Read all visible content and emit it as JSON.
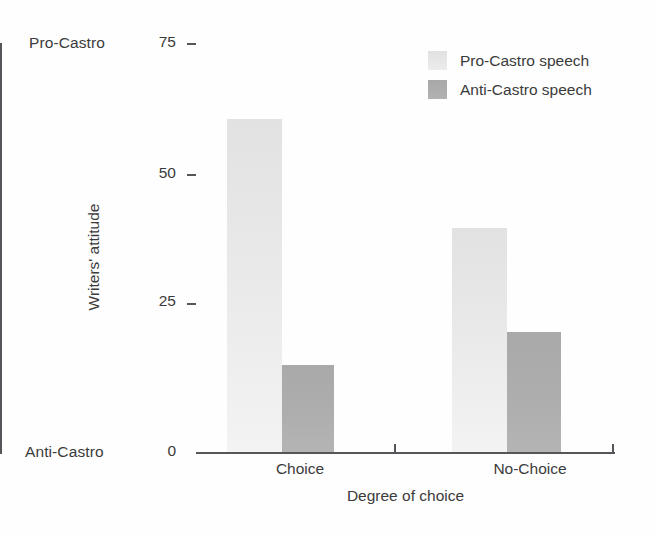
{
  "chart_data": {
    "type": "bar",
    "title": "",
    "xlabel": "Degree of choice",
    "ylabel": "Writers' attitude",
    "categories": [
      "Choice",
      "No-Choice"
    ],
    "series": [
      {
        "name": "Pro-Castro speech",
        "values": [
          61,
          41
        ],
        "color": "#e6e6e6"
      },
      {
        "name": "Anti-Castro speech",
        "values": [
          16,
          22
        ],
        "color": "#adadad"
      }
    ],
    "ylim": [
      0,
      75
    ],
    "yticks": [
      0,
      25,
      50,
      75
    ],
    "ytick_labels": [
      "0",
      "25",
      "50",
      "75"
    ],
    "y_axis_endpoints": {
      "high": "Pro-Castro",
      "low": "Anti-Castro"
    },
    "grid": false,
    "legend_position": "top-right"
  },
  "axes": {
    "y_top_anchor": "Pro-Castro",
    "y_bottom_anchor": "Anti-Castro",
    "y_title": "Writers' attitude",
    "x_title": "Degree of choice",
    "y_tick_75": "75",
    "y_tick_50": "50",
    "y_tick_25": "25",
    "y_tick_0": "0",
    "x_cat_0": "Choice",
    "x_cat_1": "No-Choice"
  },
  "legend": {
    "items": [
      {
        "label": "Pro-Castro speech",
        "swatch": "light"
      },
      {
        "label": "Anti-Castro speech",
        "swatch": "dark"
      }
    ]
  }
}
